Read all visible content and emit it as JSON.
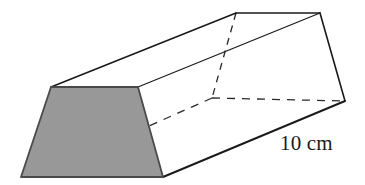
{
  "figure": {
    "name": "trapezoidal-prism",
    "background_color": "#ffffff",
    "stroke_color": "#1a1a1a",
    "shaded_face_fill": "#989898",
    "shaded_face_stroke": "#4a4a4a",
    "hidden_edge_style": "dashed"
  },
  "labels": {
    "length": "10 cm"
  },
  "geometry": {
    "front_face": {
      "name": "shaded-trapezoid-face",
      "points": "51,87 138,87 163,177 21,177",
      "top_left": [
        51,
        87
      ],
      "top_right": [
        138,
        87
      ],
      "bottom_right": [
        163,
        177
      ],
      "bottom_left": [
        21,
        177
      ]
    },
    "top_face": {
      "name": "top-face",
      "points": "51,87 138,87 320,13 236,13"
    },
    "right_face": {
      "name": "right-side-face",
      "points": "138,87 163,177 345,101 320,13"
    },
    "back_face": {
      "name": "back-trapezoid-face",
      "points": "236,13 320,13 345,101 212,98"
    },
    "hidden_edges": [
      {
        "name": "hidden-edge-vertical",
        "x1": 236,
        "y1": 13,
        "x2": 212,
        "y2": 98
      },
      {
        "name": "hidden-edge-horizontal",
        "x1": 212,
        "y1": 98,
        "x2": 345,
        "y2": 101
      },
      {
        "name": "hidden-edge-diagonal",
        "x1": 212,
        "y1": 98,
        "x2": 149,
        "y2": 126
      }
    ],
    "visible_edges": [
      {
        "name": "edge-front-top",
        "x1": 51,
        "y1": 87,
        "x2": 138,
        "y2": 87
      },
      {
        "name": "edge-front-left",
        "x1": 51,
        "y1": 87,
        "x2": 21,
        "y2": 177
      },
      {
        "name": "edge-front-bottom",
        "x1": 21,
        "y1": 177,
        "x2": 163,
        "y2": 177
      },
      {
        "name": "edge-front-right",
        "x1": 138,
        "y1": 87,
        "x2": 163,
        "y2": 177
      },
      {
        "name": "edge-top-left-long",
        "x1": 51,
        "y1": 87,
        "x2": 236,
        "y2": 13
      },
      {
        "name": "edge-top-right-long",
        "x1": 138,
        "y1": 87,
        "x2": 320,
        "y2": 13
      },
      {
        "name": "edge-back-top",
        "x1": 236,
        "y1": 13,
        "x2": 320,
        "y2": 13
      },
      {
        "name": "edge-back-right",
        "x1": 320,
        "y1": 13,
        "x2": 345,
        "y2": 101
      },
      {
        "name": "edge-bottom-long",
        "x1": 163,
        "y1": 177,
        "x2": 345,
        "y2": 101
      }
    ]
  }
}
